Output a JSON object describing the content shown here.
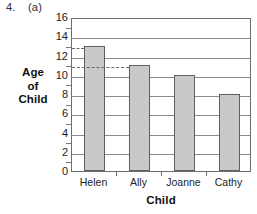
{
  "header": {
    "question_number": "4.",
    "part": "(a)"
  },
  "chart_data": {
    "type": "bar",
    "title": "",
    "categories": [
      "Helen",
      "Ally",
      "Joanne",
      "Cathy"
    ],
    "values": [
      13,
      11,
      10,
      8
    ],
    "xlabel": "Child",
    "ylabel": "Age of Child",
    "ylabel_lines": [
      "Age",
      "of",
      "Child"
    ],
    "ylim": [
      0,
      16
    ],
    "ytick_labels": [
      "0",
      "2",
      "4",
      "6",
      "8",
      "10",
      "12",
      "14",
      "16"
    ],
    "ytick_values": [
      0,
      2,
      4,
      6,
      8,
      10,
      12,
      14,
      16
    ],
    "minor_tick_values": [
      1,
      3,
      5,
      7,
      9,
      11,
      13,
      15
    ],
    "grid": true,
    "legend": "none",
    "bar_color": "#c9c9c9",
    "bar_edge_color": "#5f5f5f",
    "grid_color": "#8a8a8a",
    "annotations": [
      {
        "label": "guide-13",
        "value": 13,
        "target": "Helen",
        "style": "dashed"
      },
      {
        "label": "guide-11",
        "value": 11,
        "target": "Ally",
        "style": "dashed"
      }
    ]
  }
}
